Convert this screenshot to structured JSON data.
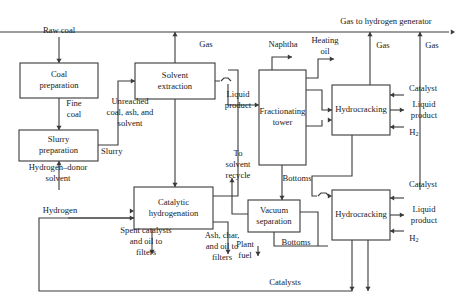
{
  "diagram": {
    "stroke_color": "#3a3a3a",
    "text_color": "#1a1a1a",
    "background_color": "#ffffff",
    "width": 465,
    "height": 304
  },
  "units": [
    {
      "id": "coal-preparation",
      "label_lines": [
        "Coal",
        "preparation"
      ],
      "x": 20,
      "y": 63,
      "w": 78,
      "h": 35
    },
    {
      "id": "slurry-preparation",
      "label_lines": [
        "Slurry",
        "preparation"
      ],
      "x": 19,
      "y": 130,
      "w": 79,
      "h": 31
    },
    {
      "id": "solvent-extraction",
      "label_lines": [
        "Solvent",
        "extraction"
      ],
      "x": 135,
      "y": 63,
      "w": 80,
      "h": 36
    },
    {
      "id": "catalytic-hydrogenation",
      "label_lines": [
        "Catalytic",
        "hydrogenation"
      ],
      "x": 134,
      "y": 187,
      "w": 79,
      "h": 42
    },
    {
      "id": "fractionating-tower",
      "label_lines": [
        "Fractionating",
        "tower"
      ],
      "x": 259,
      "y": 70,
      "w": 47,
      "h": 95
    },
    {
      "id": "vacuum-separation",
      "label_lines": [
        "Vacuum",
        "separation"
      ],
      "x": 248,
      "y": 200,
      "w": 52,
      "h": 32
    },
    {
      "id": "hydrocracking-upper",
      "label_lines": [
        "Hydrocracking"
      ],
      "x": 332,
      "y": 85,
      "w": 58,
      "h": 50
    },
    {
      "id": "hydrocracking-lower",
      "label_lines": [
        "Hydrocracking"
      ],
      "x": 332,
      "y": 190,
      "w": 58,
      "h": 50
    }
  ],
  "streams": [
    {
      "id": "raw-coal",
      "label_lines": [
        "Raw coal"
      ],
      "x": 59,
      "y": 31,
      "anchor": "middle"
    },
    {
      "id": "fine-coal",
      "label_lines": [
        "Fine",
        "coal"
      ],
      "x": 74,
      "y": 109,
      "anchor": "middle"
    },
    {
      "id": "slurry",
      "label_lines": [
        "Slurry"
      ],
      "x": 101,
      "y": 152,
      "anchor": "start"
    },
    {
      "id": "hydrogen-donor-solvent",
      "label_lines": [
        "Hydrogen–donor",
        "solvent"
      ],
      "x": 58,
      "y": 173,
      "anchor": "middle"
    },
    {
      "id": "hydrogen",
      "label_lines": [
        "Hydrogen"
      ],
      "x": 60,
      "y": 211,
      "anchor": "middle"
    },
    {
      "id": "unreached-coal-ash-solvent",
      "label_lines": [
        "Unreached",
        "coal, ash, and",
        "solvent"
      ],
      "x": 130,
      "y": 113,
      "anchor": "middle"
    },
    {
      "id": "gas-solvent-extraction",
      "label_lines": [
        "Gas"
      ],
      "x": 206,
      "y": 45,
      "anchor": "middle"
    },
    {
      "id": "spent-catalysts",
      "label_lines": [
        "Spent catalysts",
        "and oil to",
        "filters"
      ],
      "x": 146,
      "y": 242,
      "anchor": "middle"
    },
    {
      "id": "ash-char-oil",
      "label_lines": [
        "Ash, char,",
        "and oil to",
        "filters"
      ],
      "x": 222,
      "y": 247,
      "anchor": "middle"
    },
    {
      "id": "liquid-product-extract",
      "label_lines": [
        "Liquid",
        "product"
      ],
      "x": 238,
      "y": 100,
      "anchor": "middle"
    },
    {
      "id": "to-solvent-recycle",
      "label_lines": [
        "To",
        "solvent",
        "recycle"
      ],
      "x": 238,
      "y": 165,
      "anchor": "middle"
    },
    {
      "id": "naphtha",
      "label_lines": [
        "Naphtha"
      ],
      "x": 283,
      "y": 45,
      "anchor": "middle"
    },
    {
      "id": "heating-oil",
      "label_lines": [
        "Heating",
        "oil"
      ],
      "x": 325,
      "y": 46,
      "anchor": "middle"
    },
    {
      "id": "bottoms-tower",
      "label_lines": [
        "Bottoms"
      ],
      "x": 297,
      "y": 179,
      "anchor": "middle"
    },
    {
      "id": "bottoms-vacuum",
      "label_lines": [
        "Bottoms"
      ],
      "x": 296,
      "y": 243,
      "anchor": "middle"
    },
    {
      "id": "plant-fuel",
      "label_lines": [
        "Plant",
        "fuel"
      ],
      "x": 245,
      "y": 250,
      "anchor": "middle"
    },
    {
      "id": "catalysts-bus",
      "label_lines": [
        "Catalysts"
      ],
      "x": 285,
      "y": 283,
      "anchor": "middle"
    },
    {
      "id": "gas-to-hydrogen-generator",
      "label_lines": [
        "Gas to hydrogen generator"
      ],
      "x": 386,
      "y": 22,
      "anchor": "middle"
    },
    {
      "id": "gas-upper-hydrocracker",
      "label_lines": [
        "Gas"
      ],
      "x": 383,
      "y": 46,
      "anchor": "middle"
    },
    {
      "id": "gas-lower-hydrocracker",
      "label_lines": [
        "Gas"
      ],
      "x": 432,
      "y": 46,
      "anchor": "middle"
    },
    {
      "id": "catalyst-upper",
      "label_lines": [
        "Catalyst"
      ],
      "x": 423,
      "y": 89,
      "anchor": "middle"
    },
    {
      "id": "liquid-product-upper",
      "label_lines": [
        "Liquid",
        "product"
      ],
      "x": 424,
      "y": 110,
      "anchor": "middle"
    },
    {
      "id": "h2-upper",
      "label_lines": [
        "H2"
      ],
      "x": 414,
      "y": 133,
      "anchor": "middle",
      "subscript": true
    },
    {
      "id": "catalyst-lower",
      "label_lines": [
        "Catalyst"
      ],
      "x": 423,
      "y": 185,
      "anchor": "middle"
    },
    {
      "id": "liquid-product-lower",
      "label_lines": [
        "Liquid",
        "product"
      ],
      "x": 424,
      "y": 215,
      "anchor": "middle"
    },
    {
      "id": "h2-lower",
      "label_lines": [
        "H2"
      ],
      "x": 414,
      "y": 239,
      "anchor": "middle",
      "subscript": true
    }
  ],
  "connectors": [
    {
      "id": "raw-coal-feed",
      "d": "M 59 37 L 59 63"
    },
    {
      "id": "fine-coal-feed",
      "d": "M 59 98 L 59 130"
    },
    {
      "id": "hydrogen-donor-feed",
      "d": "M 59 190 L 59 161"
    },
    {
      "id": "slurry-to-extraction",
      "d": "M 98 145 L 118 145 L 118 81 L 135 81"
    },
    {
      "id": "gas-from-extraction",
      "d": "M 175 63 L 175 32"
    },
    {
      "id": "extraction-to-hydrogenation",
      "d": "M 175 99 L 175 187"
    },
    {
      "id": "extraction-liquid-out",
      "d": "M 215 81 L 228 81 L 228 105 L 259 105"
    },
    {
      "id": "hydrogenation-recycle-up",
      "d": "M 213 196 L 238 196 L 238 70 L 228 70"
    },
    {
      "id": "hydrogen-feed",
      "d": "M 68 218 L 134 218"
    },
    {
      "id": "spent-catalysts-out",
      "d": "M 152 229 L 152 254"
    },
    {
      "id": "ash-char-out",
      "d": "M 228 229 L 228 254 M 213 222 L 228 222 L 228 229"
    },
    {
      "id": "tower-naphtha-out",
      "d": "M 272 70 L 272 57 L 292 57"
    },
    {
      "id": "tower-heating-oil-out",
      "d": "M 306 78 L 318 78 L 318 59 L 334 59"
    },
    {
      "id": "tower-bottoms-out",
      "d": "M 282 165 L 282 200"
    },
    {
      "id": "tower-side-to-upper-hc",
      "d": "M 306 90 L 322 90 L 322 110 L 332 110"
    },
    {
      "id": "solvent-recycle-up",
      "d": "M 248 214 L 232 214 L 232 178"
    },
    {
      "id": "vacuum-bottoms-out",
      "d": "M 274 232 L 274 246 L 328 246"
    },
    {
      "id": "plant-fuel-out",
      "d": "M 258 246 L 258 256"
    },
    {
      "id": "vacuum-to-lower-hc",
      "d": "M 300 212 L 318 212 L 318 246"
    },
    {
      "id": "gas-upper-hc-riser",
      "d": "M 370 85 L 370 32"
    },
    {
      "id": "gas-lower-hc-riser",
      "d": "M 420 190 L 420 32"
    },
    {
      "id": "gas-main-bus",
      "d": "M 0 32 L 449 32"
    },
    {
      "id": "catalyst-upper-feed",
      "d": "M 404 95 L 390 95"
    },
    {
      "id": "liquid-product-upper-out",
      "d": "M 390 110 L 404 110"
    },
    {
      "id": "h2-upper-feed",
      "d": "M 404 127 L 390 127"
    },
    {
      "id": "catalyst-lower-feed",
      "d": "M 404 198 L 390 198"
    },
    {
      "id": "liquid-product-lower-out",
      "d": "M 390 215 L 404 215"
    },
    {
      "id": "h2-lower-feed",
      "d": "M 404 231 L 390 231"
    },
    {
      "id": "upper-hc-bottom-down",
      "d": "M 352 135 L 352 176 L 312 176 L 312 196 L 322 196"
    },
    {
      "id": "upper-hc-left-feed",
      "d": "M 300 126 L 322 126 L 322 120"
    },
    {
      "id": "catalysts-return-bus",
      "d": "M 352 240 L 352 291 L 39 291 L 39 218 L 134 218"
    },
    {
      "id": "lower-hc-bottom-return",
      "d": "M 368 240 L 368 291"
    },
    {
      "id": "catalysts-bus-to-right",
      "d": "M 345 291 L 345 291"
    }
  ],
  "arrowheads": [
    {
      "id": "arrow-raw-coal",
      "x": 59,
      "y": 63,
      "dir": "down"
    },
    {
      "id": "arrow-fine-coal",
      "x": 59,
      "y": 130,
      "dir": "down"
    },
    {
      "id": "arrow-hydrogen-donor",
      "x": 59,
      "y": 161,
      "dir": "up"
    },
    {
      "id": "arrow-slurry-in",
      "x": 135,
      "y": 81,
      "dir": "right"
    },
    {
      "id": "arrow-gas-extraction",
      "x": 175,
      "y": 32,
      "dir": "up"
    },
    {
      "id": "arrow-to-hydrogenation",
      "x": 175,
      "y": 187,
      "dir": "down"
    },
    {
      "id": "arrow-liquid-to-tower",
      "x": 259,
      "y": 105,
      "dir": "right"
    },
    {
      "id": "arrow-hydrogen-in",
      "x": 134,
      "y": 218,
      "dir": "right"
    },
    {
      "id": "arrow-hydrogen-donor-in",
      "x": 134,
      "y": 211,
      "dir": "right"
    },
    {
      "id": "arrow-spent-catalysts",
      "x": 152,
      "y": 254,
      "dir": "down"
    },
    {
      "id": "arrow-ash-char",
      "x": 228,
      "y": 254,
      "dir": "down"
    },
    {
      "id": "arrow-naphtha",
      "x": 292,
      "y": 57,
      "dir": "right"
    },
    {
      "id": "arrow-heating-oil",
      "x": 334,
      "y": 59,
      "dir": "right"
    },
    {
      "id": "arrow-tower-bottoms",
      "x": 282,
      "y": 200,
      "dir": "down"
    },
    {
      "id": "arrow-solvent-recycle",
      "x": 232,
      "y": 178,
      "dir": "up"
    },
    {
      "id": "arrow-plant-fuel",
      "x": 258,
      "y": 256,
      "dir": "down"
    },
    {
      "id": "arrow-gas-upper-hc",
      "x": 370,
      "y": 32,
      "dir": "up"
    },
    {
      "id": "arrow-gas-lower-hc",
      "x": 420,
      "y": 32,
      "dir": "up"
    },
    {
      "id": "arrow-gas-bus-out",
      "x": 455,
      "y": 32,
      "dir": "right"
    },
    {
      "id": "arrow-catalyst-upper",
      "x": 390,
      "y": 95,
      "dir": "left"
    },
    {
      "id": "arrow-liquid-upper",
      "x": 404,
      "y": 110,
      "dir": "right"
    },
    {
      "id": "arrow-h2-upper",
      "x": 390,
      "y": 127,
      "dir": "left"
    },
    {
      "id": "arrow-catalyst-lower",
      "x": 390,
      "y": 198,
      "dir": "left"
    },
    {
      "id": "arrow-liquid-lower",
      "x": 404,
      "y": 215,
      "dir": "right"
    },
    {
      "id": "arrow-h2-lower",
      "x": 390,
      "y": 231,
      "dir": "left"
    },
    {
      "id": "arrow-upper-hc-in-left",
      "x": 332,
      "y": 110,
      "dir": "right"
    },
    {
      "id": "arrow-upper-hc-in-low",
      "x": 332,
      "y": 120,
      "dir": "right"
    },
    {
      "id": "arrow-lower-hc-in-left",
      "x": 332,
      "y": 196,
      "dir": "right"
    },
    {
      "id": "arrow-catalysts-down",
      "x": 368,
      "y": 291,
      "dir": "down"
    },
    {
      "id": "arrow-catalysts-down-2",
      "x": 352,
      "y": 291,
      "dir": "down"
    }
  ],
  "hops": [
    {
      "id": "hop-extraction-outlet",
      "d": "M 221 81 L 224 78 L 228 78 L 231 81",
      "cx": 226,
      "cy": 81
    },
    {
      "id": "hop-lower-hc-inlet",
      "d": "M 318 196 L 321 193 L 326 193 L 329 196",
      "cx": 323,
      "cy": 196
    }
  ]
}
